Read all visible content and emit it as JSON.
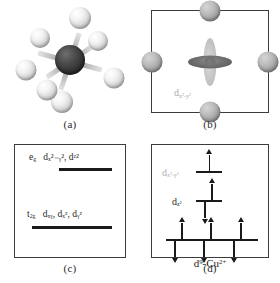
{
  "figure": {
    "panels": [
      {
        "id": "a",
        "label": "(a)",
        "type": "molecular-model",
        "description": "octahedral complex ball-and-stick model",
        "central_atom_color": "#303030",
        "ligand_color": "#f2f2f2",
        "ligand_count": 6
      },
      {
        "id": "b",
        "label": "(b)",
        "type": "orbital-in-square-field",
        "orbital_label": "d",
        "orbital_sub": "x²-y²",
        "ligand_count": 4,
        "lobe_color_horizontal": "#6f6f6f",
        "lobe_color_vertical": "#c9c9c9",
        "label_color": "#a9a9a9"
      },
      {
        "id": "c",
        "label": "(c)",
        "type": "energy-level-diagram",
        "levels": [
          {
            "symmetry": "e",
            "symmetry_sub": "g",
            "orbitals": "dₓ²₋ᵧ², dᶻ²",
            "caption": "e_g   d_{x²-y²}, d_{z²}",
            "relative_energy": "higher"
          },
          {
            "symmetry": "t",
            "symmetry_sub": "2g",
            "orbitals": "dₓᵧ, dₓᶻ, dᵧᶻ",
            "caption": "t_2g   d_{xy}, d_{xz}, d_{yz}",
            "relative_energy": "lower"
          }
        ]
      },
      {
        "id": "d",
        "label": "(d)",
        "type": "electron-configuration-diagram",
        "config_label": "d⁹-Cu²⁺",
        "config_base": "d",
        "config_exponent": "9",
        "config_ion": "Cu",
        "config_ion_charge": "2+",
        "orbitals": [
          {
            "name": "d",
            "name_sub": "x²-y²",
            "electrons": 1,
            "spins": [
              "up"
            ],
            "label_style": "dim"
          },
          {
            "name": "d",
            "name_sub": "z²",
            "electrons": 2,
            "spins": [
              "up",
              "down"
            ],
            "label_style": "solid"
          }
        ],
        "t2g_set": {
          "orbital_count": 3,
          "electrons_each": 2,
          "spins_each": [
            "up",
            "down"
          ]
        }
      }
    ]
  }
}
